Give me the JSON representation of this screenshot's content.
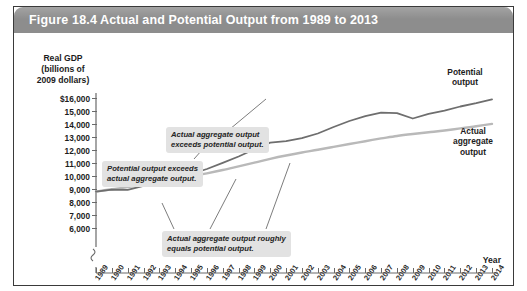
{
  "figure": {
    "number_label": "Figure 18.4",
    "title": "Actual and Potential Output from 1989 to 2013"
  },
  "colors": {
    "title_bar": "#8d8d8d",
    "title_text": "#ffffff",
    "callout_bg": "#e2e2e2",
    "potential_line": "#b9b9b9",
    "actual_line": "#6e6e6e",
    "axis": "#6a6a6a",
    "frame": "#3a3a3a"
  },
  "annotations": [
    {
      "id": "exceeds-potential",
      "text_line1": "Actual aggregate output",
      "text_line2": "exceeds potential output."
    },
    {
      "id": "potential-exceeds-actual",
      "text_line1": "Potential output exceeds",
      "text_line2": "actual aggregate output."
    },
    {
      "id": "roughly-equals",
      "text_line1": "Actual aggregate output roughly",
      "text_line2": "equals potential output."
    }
  ],
  "series_labels": {
    "potential_line1": "Potential",
    "potential_line2": "output",
    "actual_line1": "Actual",
    "actual_line2": "aggregate",
    "actual_line3": "output"
  },
  "chart_data": {
    "type": "line",
    "title": "Actual and Potential Output from 1989 to 2013",
    "xlabel": "Year",
    "ylabel": "Real GDP (billions of 2009 dollars)",
    "ylabel_lines": [
      "Real GDP",
      "(billions of",
      "2009 dollars)"
    ],
    "xlim": [
      1989,
      2014
    ],
    "ylim": [
      6000,
      16000
    ],
    "y_axis_break": true,
    "grid": false,
    "legend_position": "right-inline",
    "ytick_labels": [
      "$16,000",
      "15,000",
      "14,000",
      "13,000",
      "12,000",
      "11,000",
      "10,000",
      "9,000",
      "8,000",
      "7,000",
      "6,000"
    ],
    "ytick_values": [
      16000,
      15000,
      14000,
      13000,
      12000,
      11000,
      10000,
      9000,
      8000,
      7000,
      6000
    ],
    "x": [
      1989,
      1990,
      1991,
      1992,
      1993,
      1994,
      1995,
      1996,
      1997,
      1998,
      1999,
      2000,
      2001,
      2002,
      2003,
      2004,
      2005,
      2006,
      2007,
      2008,
      2009,
      2010,
      2011,
      2012,
      2013,
      2014
    ],
    "xtick_labels": [
      "1989",
      "1990",
      "1991",
      "1992",
      "1993",
      "1994",
      "1995",
      "1996",
      "1997",
      "1998",
      "1999",
      "2000",
      "2001",
      "2002",
      "2003",
      "2004",
      "2005",
      "2006",
      "2007",
      "2008",
      "2009",
      "2010",
      "2011",
      "2012",
      "2013",
      "2014"
    ],
    "series": [
      {
        "name": "Potential output",
        "color": "#b9b9b9",
        "values": [
          8800,
          8980,
          9150,
          9340,
          9530,
          9740,
          9960,
          10200,
          10460,
          10740,
          11030,
          11320,
          11580,
          11810,
          12020,
          12240,
          12460,
          12680,
          12890,
          13080,
          13230,
          13360,
          13500,
          13660,
          13830,
          14010
        ]
      },
      {
        "name": "Actual aggregate output",
        "color": "#6e6e6e",
        "values": [
          8800,
          8950,
          8940,
          9250,
          9510,
          9900,
          10150,
          10540,
          11010,
          11500,
          12050,
          12560,
          12680,
          12910,
          13270,
          13770,
          14230,
          14610,
          14880,
          14830,
          14420,
          14780,
          15020,
          15350,
          15600,
          15900
        ]
      }
    ]
  }
}
